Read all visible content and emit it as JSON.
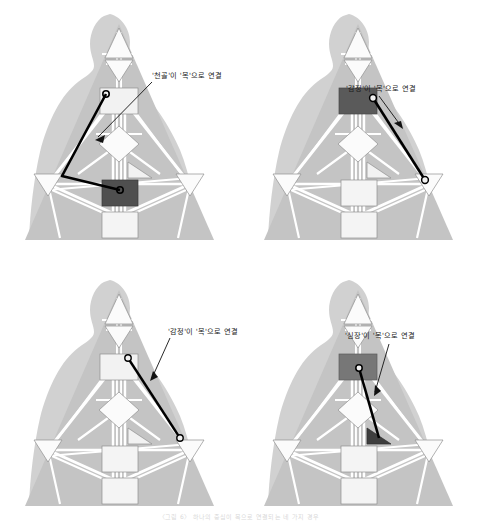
{
  "figure": {
    "title_caption": "〈그림 6〉 하나의 중심이 목으로 연결되는 네 가지 경우",
    "colors": {
      "body_silhouette": "#c9c9c9",
      "triangle_fill": "#c4c4c4",
      "lattice_line": "#ffffff",
      "node_fill": "#f2f2f2",
      "node_stroke": "#9a9a9a",
      "highlight_path": "#000000",
      "highlight_node_dark": "#4a4a4a",
      "annotation_text": "#1b1b1b",
      "page_background": "#ffffff"
    },
    "panel_count": 4,
    "panel_layout": "2x2 grid"
  },
  "panels": [
    {
      "id": "panel-top-left",
      "annotation": "'천골'이 '목'으로 연결",
      "source_center": "천골",
      "target_center": "목",
      "highlight_shape": "square",
      "path_type": "polyline",
      "path_points": "throat -> left-waist -> sacral",
      "highlighted_node": "sacral-center",
      "arrow_direction": "down-left"
    },
    {
      "id": "panel-top-right",
      "annotation": "'감정'이 '목'으로 연결",
      "source_center": "감정",
      "target_center": "목",
      "highlight_shape": "triangle-right",
      "path_type": "straight",
      "path_points": "throat -> right-solar-plexus",
      "highlighted_node": "throat-center",
      "arrow_direction": "down-right"
    },
    {
      "id": "panel-bottom-left",
      "annotation": "'감정'이 '목'으로 연결",
      "source_center": "감정",
      "target_center": "목",
      "highlight_shape": "triangle-right",
      "path_type": "straight",
      "path_points": "throat -> right-solar-plexus",
      "highlighted_node": "none",
      "arrow_direction": "down-left"
    },
    {
      "id": "panel-bottom-right",
      "annotation": "'심장'이 '목'으로 연결",
      "source_center": "심장",
      "target_center": "목",
      "highlight_shape": "triangle-dark",
      "path_type": "straight",
      "path_points": "throat -> heart",
      "highlighted_node": "heart-center",
      "arrow_direction": "down-right"
    }
  ],
  "diagram_labels": {
    "crown_row": "64 61 63",
    "ajna_row": "47 24 4",
    "throat_row": "17 11 56",
    "throat_row2": "62 23 43",
    "throat_row3": "16 20 31 8 33 35 12 45",
    "g_center": "7 1 13 10 25 46 15 2",
    "heart_small": "21 51 26 40",
    "spleen": "48 57 44 50 32 28 18",
    "sacral": "5 14 29 59 9 3 42 27 34",
    "solar_plexus": "6 37 22 36 30 55 49 0 13",
    "root": "53 60 52 54 38 58 41 19 39"
  }
}
